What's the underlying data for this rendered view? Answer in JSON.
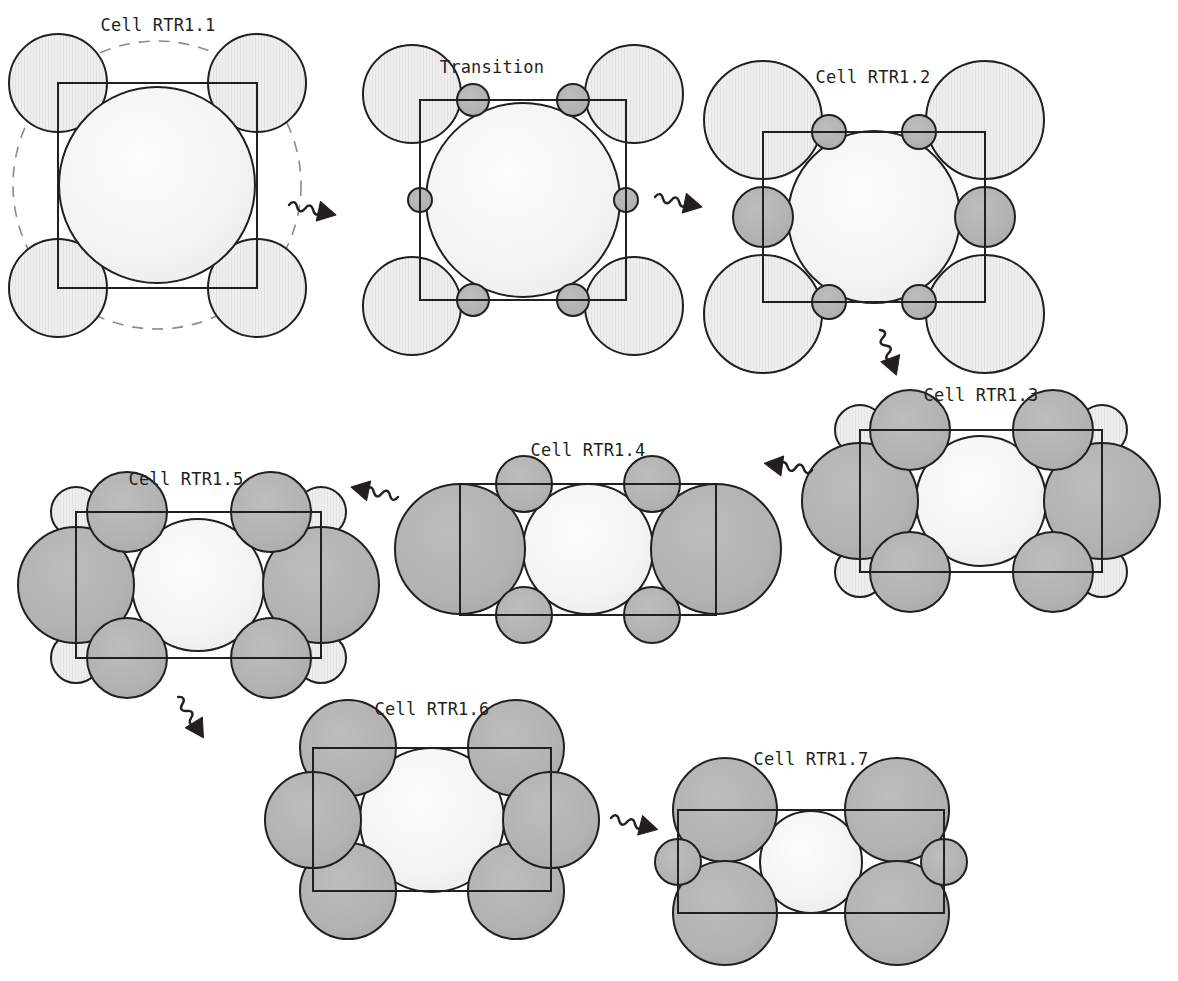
{
  "figure": {
    "type": "diagram",
    "background_color": "#ffffff",
    "stroke_color": "#231f20",
    "colors": {
      "light_sphere_fill": "#f2f2f2",
      "pale_sphere_fill": "#ededed",
      "gray_sphere_fill": "#b3b3b3",
      "dashed_guide": "#8a8a8a",
      "outline": "#231f20",
      "label_text": "#231f20"
    },
    "line_widths": {
      "cell_box": 2.0,
      "sphere_outline": 2.0,
      "dashed_guide": 1.6
    }
  },
  "panels": [
    {
      "id": "rtr1-1",
      "label": "Cell RTR1.1",
      "label_pos": {
        "x": 158,
        "y": 18
      },
      "box": {
        "x": 58,
        "y": 83,
        "w": 199,
        "h": 205
      },
      "dashed_circles": [
        {
          "cx": 157,
          "cy": 185,
          "r": 144
        }
      ],
      "spheres": [
        {
          "name": "center-sphere",
          "cx": 157,
          "cy": 185,
          "r": 98,
          "fill": "light"
        },
        {
          "name": "corner-sphere-tl",
          "cx": 58,
          "cy": 83,
          "r": 49,
          "fill": "pale"
        },
        {
          "name": "corner-sphere-tr",
          "cx": 257,
          "cy": 83,
          "r": 49,
          "fill": "pale"
        },
        {
          "name": "corner-sphere-bl",
          "cx": 58,
          "cy": 288,
          "r": 49,
          "fill": "pale"
        },
        {
          "name": "corner-sphere-br",
          "cx": 257,
          "cy": 288,
          "r": 49,
          "fill": "pale"
        }
      ]
    },
    {
      "id": "transition",
      "label": "Transition",
      "label_pos": {
        "x": 492,
        "y": 60
      },
      "box": {
        "x": 420,
        "y": 100,
        "w": 206,
        "h": 200
      },
      "dashed_circles": [],
      "spheres": [
        {
          "name": "center-sphere",
          "cx": 523,
          "cy": 200,
          "r": 97,
          "fill": "light"
        },
        {
          "name": "corner-sphere-tl",
          "cx": 412,
          "cy": 94,
          "r": 49,
          "fill": "pale"
        },
        {
          "name": "corner-sphere-tr",
          "cx": 634,
          "cy": 94,
          "r": 49,
          "fill": "pale"
        },
        {
          "name": "corner-sphere-bl",
          "cx": 412,
          "cy": 306,
          "r": 49,
          "fill": "pale"
        },
        {
          "name": "corner-sphere-br",
          "cx": 634,
          "cy": 306,
          "r": 49,
          "fill": "pale"
        },
        {
          "name": "edge-sphere-top-left",
          "cx": 473,
          "cy": 100,
          "r": 16,
          "fill": "gray"
        },
        {
          "name": "edge-sphere-top-right",
          "cx": 573,
          "cy": 100,
          "r": 16,
          "fill": "gray"
        },
        {
          "name": "edge-sphere-bottom-left",
          "cx": 473,
          "cy": 300,
          "r": 16,
          "fill": "gray"
        },
        {
          "name": "edge-sphere-bottom-right",
          "cx": 573,
          "cy": 300,
          "r": 16,
          "fill": "gray"
        },
        {
          "name": "edge-sphere-left",
          "cx": 420,
          "cy": 200,
          "r": 12,
          "fill": "gray"
        },
        {
          "name": "edge-sphere-right",
          "cx": 626,
          "cy": 200,
          "r": 12,
          "fill": "gray"
        }
      ]
    },
    {
      "id": "rtr1-2",
      "label": "Cell RTR1.2",
      "label_pos": {
        "x": 873,
        "y": 70
      },
      "box": {
        "x": 763,
        "y": 132,
        "w": 222,
        "h": 170
      },
      "dashed_circles": [],
      "spheres": [
        {
          "name": "center-sphere",
          "cx": 874,
          "cy": 217,
          "r": 86,
          "fill": "light"
        },
        {
          "name": "corner-sphere-tl",
          "cx": 763,
          "cy": 120,
          "r": 59,
          "fill": "pale"
        },
        {
          "name": "corner-sphere-tr",
          "cx": 985,
          "cy": 120,
          "r": 59,
          "fill": "pale"
        },
        {
          "name": "corner-sphere-bl",
          "cx": 763,
          "cy": 314,
          "r": 59,
          "fill": "pale"
        },
        {
          "name": "corner-sphere-br",
          "cx": 985,
          "cy": 314,
          "r": 59,
          "fill": "pale"
        },
        {
          "name": "edge-sphere-top-left",
          "cx": 829,
          "cy": 132,
          "r": 17,
          "fill": "gray"
        },
        {
          "name": "edge-sphere-top-right",
          "cx": 919,
          "cy": 132,
          "r": 17,
          "fill": "gray"
        },
        {
          "name": "edge-sphere-bottom-left",
          "cx": 829,
          "cy": 302,
          "r": 17,
          "fill": "gray"
        },
        {
          "name": "edge-sphere-bottom-right",
          "cx": 919,
          "cy": 302,
          "r": 17,
          "fill": "gray"
        },
        {
          "name": "edge-sphere-left",
          "cx": 763,
          "cy": 217,
          "r": 30,
          "fill": "gray"
        },
        {
          "name": "edge-sphere-right",
          "cx": 985,
          "cy": 217,
          "r": 30,
          "fill": "gray"
        }
      ]
    },
    {
      "id": "rtr1-3",
      "label": "Cell RTR1.3",
      "label_pos": {
        "x": 981,
        "y": 388
      },
      "box": {
        "x": 860,
        "y": 430,
        "w": 242,
        "h": 142
      },
      "dashed_circles": [],
      "spheres": [
        {
          "name": "center-sphere",
          "cx": 981,
          "cy": 501,
          "r": 65,
          "fill": "light"
        },
        {
          "name": "corner-sphere-tl",
          "cx": 860,
          "cy": 430,
          "r": 25,
          "fill": "pale"
        },
        {
          "name": "corner-sphere-tr",
          "cx": 1102,
          "cy": 430,
          "r": 25,
          "fill": "pale"
        },
        {
          "name": "corner-sphere-bl",
          "cx": 860,
          "cy": 572,
          "r": 25,
          "fill": "pale"
        },
        {
          "name": "corner-sphere-br",
          "cx": 1102,
          "cy": 572,
          "r": 25,
          "fill": "pale"
        },
        {
          "name": "side-sphere-left",
          "cx": 860,
          "cy": 501,
          "r": 58,
          "fill": "gray"
        },
        {
          "name": "side-sphere-right",
          "cx": 1102,
          "cy": 501,
          "r": 58,
          "fill": "gray"
        },
        {
          "name": "edge-sphere-top-left",
          "cx": 910,
          "cy": 430,
          "r": 40,
          "fill": "gray"
        },
        {
          "name": "edge-sphere-top-right",
          "cx": 1053,
          "cy": 430,
          "r": 40,
          "fill": "gray"
        },
        {
          "name": "edge-sphere-bottom-left",
          "cx": 910,
          "cy": 572,
          "r": 40,
          "fill": "gray"
        },
        {
          "name": "edge-sphere-bottom-right",
          "cx": 1053,
          "cy": 572,
          "r": 40,
          "fill": "gray"
        }
      ]
    },
    {
      "id": "rtr1-4",
      "label": "Cell RTR1.4",
      "label_pos": {
        "x": 588,
        "y": 443
      },
      "box": {
        "x": 460,
        "y": 484,
        "w": 256,
        "h": 131
      },
      "dashed_circles": [],
      "spheres": [
        {
          "name": "center-sphere",
          "cx": 588,
          "cy": 549,
          "r": 65,
          "fill": "light"
        },
        {
          "name": "side-sphere-left",
          "cx": 460,
          "cy": 549,
          "r": 65,
          "fill": "gray"
        },
        {
          "name": "side-sphere-right",
          "cx": 716,
          "cy": 549,
          "r": 65,
          "fill": "gray"
        },
        {
          "name": "edge-sphere-top-left",
          "cx": 524,
          "cy": 484,
          "r": 28,
          "fill": "gray"
        },
        {
          "name": "edge-sphere-top-right",
          "cx": 652,
          "cy": 484,
          "r": 28,
          "fill": "gray"
        },
        {
          "name": "edge-sphere-bottom-left",
          "cx": 524,
          "cy": 615,
          "r": 28,
          "fill": "gray"
        },
        {
          "name": "edge-sphere-bottom-right",
          "cx": 652,
          "cy": 615,
          "r": 28,
          "fill": "gray"
        }
      ]
    },
    {
      "id": "rtr1-5",
      "label": "Cell RTR1.5",
      "label_pos": {
        "x": 186,
        "y": 472
      },
      "box": {
        "x": 76,
        "y": 512,
        "w": 245,
        "h": 146
      },
      "dashed_circles": [],
      "spheres": [
        {
          "name": "center-sphere",
          "cx": 198,
          "cy": 585,
          "r": 66,
          "fill": "light"
        },
        {
          "name": "corner-sphere-tl",
          "cx": 76,
          "cy": 512,
          "r": 25,
          "fill": "pale"
        },
        {
          "name": "corner-sphere-tr",
          "cx": 321,
          "cy": 512,
          "r": 25,
          "fill": "pale"
        },
        {
          "name": "corner-sphere-bl",
          "cx": 76,
          "cy": 658,
          "r": 25,
          "fill": "pale"
        },
        {
          "name": "corner-sphere-br",
          "cx": 321,
          "cy": 658,
          "r": 25,
          "fill": "pale"
        },
        {
          "name": "side-sphere-left",
          "cx": 76,
          "cy": 585,
          "r": 58,
          "fill": "gray"
        },
        {
          "name": "side-sphere-right",
          "cx": 321,
          "cy": 585,
          "r": 58,
          "fill": "gray"
        },
        {
          "name": "edge-sphere-top-left",
          "cx": 127,
          "cy": 512,
          "r": 40,
          "fill": "gray"
        },
        {
          "name": "edge-sphere-top-right",
          "cx": 271,
          "cy": 512,
          "r": 40,
          "fill": "gray"
        },
        {
          "name": "edge-sphere-bottom-left",
          "cx": 127,
          "cy": 658,
          "r": 40,
          "fill": "gray"
        },
        {
          "name": "edge-sphere-bottom-right",
          "cx": 271,
          "cy": 658,
          "r": 40,
          "fill": "gray"
        }
      ]
    },
    {
      "id": "rtr1-6",
      "label": "Cell RTR1.6",
      "label_pos": {
        "x": 432,
        "y": 702
      },
      "box": {
        "x": 313,
        "y": 748,
        "w": 238,
        "h": 143
      },
      "dashed_circles": [],
      "spheres": [
        {
          "name": "center-sphere",
          "cx": 432,
          "cy": 820,
          "r": 72,
          "fill": "light"
        },
        {
          "name": "corner-sphere-tl",
          "cx": 348,
          "cy": 748,
          "r": 48,
          "fill": "gray"
        },
        {
          "name": "corner-sphere-tr",
          "cx": 516,
          "cy": 748,
          "r": 48,
          "fill": "gray"
        },
        {
          "name": "corner-sphere-bl",
          "cx": 348,
          "cy": 891,
          "r": 48,
          "fill": "gray"
        },
        {
          "name": "corner-sphere-br",
          "cx": 516,
          "cy": 891,
          "r": 48,
          "fill": "gray"
        },
        {
          "name": "side-sphere-left",
          "cx": 313,
          "cy": 820,
          "r": 48,
          "fill": "gray"
        },
        {
          "name": "side-sphere-right",
          "cx": 551,
          "cy": 820,
          "r": 48,
          "fill": "gray"
        }
      ]
    },
    {
      "id": "rtr1-7",
      "label": "Cell RTR1.7",
      "label_pos": {
        "x": 811,
        "y": 752
      },
      "box": {
        "x": 678,
        "y": 810,
        "w": 266,
        "h": 103
      },
      "dashed_circles": [],
      "spheres": [
        {
          "name": "center-sphere",
          "cx": 811,
          "cy": 862,
          "r": 51,
          "fill": "light"
        },
        {
          "name": "corner-sphere-tl",
          "cx": 725,
          "cy": 810,
          "r": 52,
          "fill": "gray"
        },
        {
          "name": "corner-sphere-tr",
          "cx": 897,
          "cy": 810,
          "r": 52,
          "fill": "gray"
        },
        {
          "name": "corner-sphere-bl",
          "cx": 725,
          "cy": 913,
          "r": 52,
          "fill": "gray"
        },
        {
          "name": "corner-sphere-br",
          "cx": 897,
          "cy": 913,
          "r": 52,
          "fill": "gray"
        },
        {
          "name": "side-sphere-left",
          "cx": 678,
          "cy": 862,
          "r": 23,
          "fill": "gray"
        },
        {
          "name": "side-sphere-right",
          "cx": 944,
          "cy": 862,
          "r": 23,
          "fill": "gray"
        }
      ]
    }
  ],
  "arrows": [
    {
      "name": "arrow-rtr1-1-to-transition",
      "from": "rtr1-1",
      "to": "transition",
      "x": 289,
      "y": 205,
      "len": 46,
      "angle": 12
    },
    {
      "name": "arrow-transition-to-rtr1-2",
      "from": "transition",
      "to": "rtr1-2",
      "x": 655,
      "y": 197,
      "len": 46,
      "angle": 12
    },
    {
      "name": "arrow-rtr1-2-to-rtr1-3",
      "from": "rtr1-2",
      "to": "rtr1-3",
      "x": 880,
      "y": 330,
      "len": 46,
      "angle": 70
    },
    {
      "name": "arrow-rtr1-3-to-rtr1-4",
      "from": "rtr1-3",
      "to": "rtr1-4",
      "x": 812,
      "y": 470,
      "len": 46,
      "angle": 188
    },
    {
      "name": "arrow-rtr1-4-to-rtr1-5",
      "from": "rtr1-4",
      "to": "rtr1-5",
      "x": 398,
      "y": 497,
      "len": 46,
      "angle": 192
    },
    {
      "name": "arrow-rtr1-5-to-rtr1-6",
      "from": "rtr1-5",
      "to": "rtr1-6",
      "x": 178,
      "y": 697,
      "len": 46,
      "angle": 58
    },
    {
      "name": "arrow-rtr1-6-to-rtr1-7",
      "from": "rtr1-6",
      "to": "rtr1-7",
      "x": 611,
      "y": 818,
      "len": 46,
      "angle": 14
    }
  ]
}
